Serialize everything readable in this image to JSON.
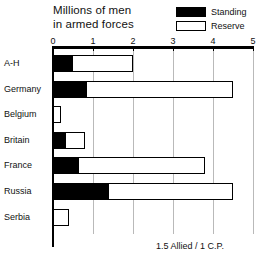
{
  "chart_data": {
    "type": "bar",
    "orientation": "horizontal",
    "stacked": true,
    "title": "Millions of men in armed forces",
    "title_lines": [
      "Millions of men",
      "in armed forces"
    ],
    "xlabel": "",
    "ylabel": "",
    "xlim": [
      0,
      5
    ],
    "xticks": [
      0,
      1,
      2,
      3,
      4,
      5
    ],
    "xtick_labels": [
      "0",
      "1",
      "2",
      "3",
      "4",
      "5"
    ],
    "grid": true,
    "grid_axis": "x",
    "legend_position": "top-right",
    "categories": [
      "A-H",
      "Germany",
      "Belgium",
      "Britain",
      "France",
      "Russia",
      "Serbia"
    ],
    "series": [
      {
        "name": "Standing",
        "color": "#000000",
        "values": [
          0.5,
          0.85,
          0.0,
          0.33,
          0.65,
          1.4,
          0.0
        ]
      },
      {
        "name": "Reserve",
        "color": "#ffffff",
        "values": [
          1.5,
          3.65,
          0.2,
          0.47,
          3.15,
          3.1,
          0.4
        ]
      }
    ],
    "totals": [
      2.0,
      4.5,
      0.2,
      0.8,
      3.8,
      4.5,
      0.4
    ],
    "annotation": "1.5 Allied / 1 C.P."
  },
  "legend": {
    "items": [
      {
        "label": "Standing",
        "swatch": "black-filled-swatch"
      },
      {
        "label": "Reserve",
        "swatch": "white-outlined-swatch"
      }
    ]
  },
  "footnote": {
    "text": "1.5 Allied / 1 C.P."
  },
  "colors": {
    "standing": "#000000",
    "reserve": "#ffffff",
    "outline": "#000000",
    "gridline": "#b9b9b9",
    "background": "#ffffff",
    "text": "#111111"
  }
}
